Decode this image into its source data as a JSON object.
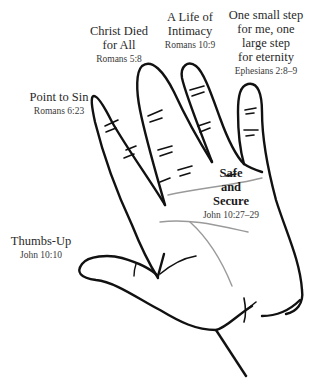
{
  "diagram": {
    "line_color": "#111111",
    "crease_color": "#9a9a9a"
  },
  "labels": {
    "pinky": {
      "title": "Point to Sin",
      "ref": "Romans 6:23"
    },
    "ring": {
      "title_line1": "Christ Died",
      "title_line2": "for All",
      "ref": "Romans 5:8"
    },
    "middle": {
      "title_line1": "A Life of",
      "title_line2": "Intimacy",
      "ref": "Romans 10:9"
    },
    "index": {
      "title_line1": "One small step",
      "title_line2": "for me, one",
      "title_line3": "large step",
      "title_line4": "for eternity",
      "ref": "Ephesians 2:8–9"
    },
    "thumb": {
      "title": "Thumbs-Up",
      "ref": "John 10:10"
    },
    "palm": {
      "line1": "Safe",
      "line2": "and",
      "line3": "Secure",
      "ref": "John 10:27–29"
    }
  }
}
